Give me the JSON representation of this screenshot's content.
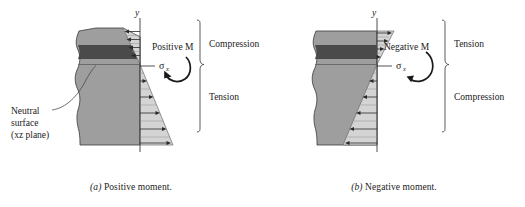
{
  "figure": {
    "panels": [
      {
        "id": "a",
        "caption_letter": "(a)",
        "caption_text": " Positive moment.",
        "axis_label": "y",
        "moment_label": "Positive M",
        "stress_symbol": "σ",
        "stress_subscript": "x",
        "upper_region_label": "Compression",
        "lower_region_label": "Tension",
        "annotation_line1": "Neutral",
        "annotation_line2": "surface",
        "annotation_line3": "(xz plane)",
        "moment_direction": "counterclockwise",
        "upper_arrow_direction": "left",
        "lower_arrow_direction": "right"
      },
      {
        "id": "b",
        "caption_letter": "(b)",
        "caption_text": " Negative moment.",
        "axis_label": "y",
        "moment_label": "Negative M",
        "stress_symbol": "σ",
        "stress_subscript": "x",
        "upper_region_label": "Tension",
        "lower_region_label": "Compression",
        "moment_direction": "clockwise",
        "upper_arrow_direction": "right",
        "lower_arrow_direction": "left"
      }
    ],
    "colors": {
      "beam_body": "#9e9e9e",
      "beam_dark_band": "#4a4a4a",
      "stress_fill": "#d4d4d4",
      "outline": "#3a3a3a",
      "text": "#1a1a1a"
    }
  }
}
